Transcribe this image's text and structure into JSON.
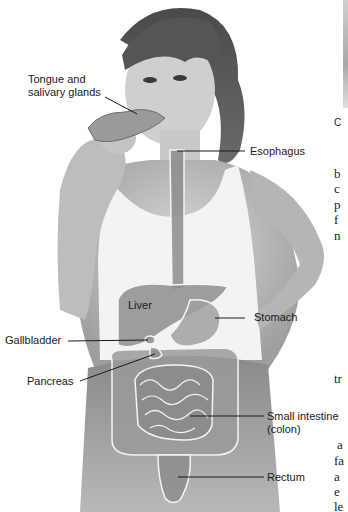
{
  "figure": {
    "labels": {
      "tongue": [
        "Tongue and",
        "salivary glands"
      ],
      "esophagus": "Esophagus",
      "liver": "Liver",
      "stomach": "Stomach",
      "gallbladder": "Gallbladder",
      "pancreas": "Pancreas",
      "small_intestine": [
        "Small intestine",
        "(colon)"
      ],
      "rectum": "Rectum"
    }
  },
  "side_column": {
    "caption_fragment": "C",
    "text_fragments_top": [
      "b",
      "c",
      "p",
      "f",
      "n"
    ],
    "text_fragment_mid": "tr",
    "text_fragments_bottom": [
      "a",
      "fa",
      "a",
      "e",
      "le"
    ]
  }
}
